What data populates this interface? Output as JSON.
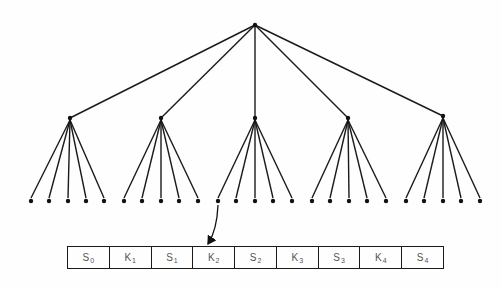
{
  "diagram": {
    "type": "tree-with-node-array",
    "colors": {
      "line": "#1a1a1a",
      "node": "#111111",
      "label": "#555555",
      "background": "#fefefe"
    },
    "root": {
      "x": 255,
      "y": 25
    },
    "level1": [
      {
        "x": 70,
        "y": 118,
        "leaves": [
          31,
          49,
          68,
          86,
          104
        ]
      },
      {
        "x": 161,
        "y": 118,
        "leaves": [
          124,
          142,
          161,
          179,
          198
        ]
      },
      {
        "x": 255,
        "y": 118,
        "leaves": [
          218,
          236,
          255,
          273,
          292
        ]
      },
      {
        "x": 348,
        "y": 118,
        "leaves": [
          312,
          330,
          349,
          367,
          386
        ]
      },
      {
        "x": 443,
        "y": 116,
        "leaves": [
          406,
          424,
          443,
          461,
          480
        ]
      }
    ],
    "leaf_y": 201,
    "arrow": {
      "from": {
        "x": 218,
        "y": 205
      },
      "to": {
        "x": 208,
        "y": 244
      },
      "description": "pointer from first leaf of middle subtree to key array"
    },
    "key_array": {
      "x": 67,
      "y": 246,
      "width": 377,
      "height": 23,
      "cells": [
        {
          "letter": "S",
          "sub": "0"
        },
        {
          "letter": "K",
          "sub": "1"
        },
        {
          "letter": "S",
          "sub": "1"
        },
        {
          "letter": "K",
          "sub": "2"
        },
        {
          "letter": "S",
          "sub": "2"
        },
        {
          "letter": "K",
          "sub": "3"
        },
        {
          "letter": "S",
          "sub": "3"
        },
        {
          "letter": "K",
          "sub": "4"
        },
        {
          "letter": "S",
          "sub": "4"
        }
      ]
    }
  }
}
